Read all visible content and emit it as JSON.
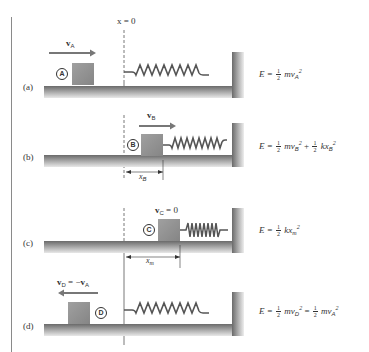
{
  "figure": {
    "origin_label": "x = 0",
    "colors": {
      "block": "#8f8f8f",
      "floor": "#6e6e6e",
      "spring": "#555555",
      "wall": "#7a7a7a",
      "text": "#333333"
    },
    "panels": [
      {
        "id": "a",
        "label": "(a)",
        "block_marker": "A",
        "velocity": {
          "symbol": "v",
          "subscript": "A",
          "direction": "right",
          "text": "v_A"
        },
        "energy": {
          "text": "E = ½ m v_A²",
          "lhs": "E =",
          "frac_num": "1",
          "frac_den": "2",
          "term1": "mv",
          "term1_sub": "A",
          "term1_sup": "2"
        },
        "spring_state": "relaxed"
      },
      {
        "id": "b",
        "label": "(b)",
        "block_marker": "B",
        "velocity": {
          "symbol": "v",
          "subscript": "B",
          "direction": "right",
          "text": "v_B"
        },
        "displacement": {
          "symbol": "x",
          "subscript": "B",
          "text": "x_B"
        },
        "energy": {
          "text": "E = ½ m v_B² + ½ k x_B²",
          "lhs": "E =",
          "frac_num": "1",
          "frac_den": "2",
          "term1": "mv",
          "term1_sub": "B",
          "term1_sup": "2",
          "plus": "+",
          "term2": "kx",
          "term2_sub": "B",
          "term2_sup": "2"
        },
        "spring_state": "compressed"
      },
      {
        "id": "c",
        "label": "(c)",
        "block_marker": "C",
        "velocity": {
          "symbol": "v",
          "subscript": "C",
          "value": "= 0",
          "text": "v_C = 0"
        },
        "displacement": {
          "symbol": "x",
          "subscript": "m",
          "text": "x_m"
        },
        "energy": {
          "text": "E = ½ k x_m²",
          "lhs": "E =",
          "frac_num": "1",
          "frac_den": "2",
          "term1": "kx",
          "term1_sub": "m",
          "term1_sup": "2"
        },
        "spring_state": "max-compressed"
      },
      {
        "id": "d",
        "label": "(d)",
        "block_marker": "D",
        "velocity": {
          "symbol": "v",
          "subscript": "D",
          "value": "= −",
          "rhs_symbol": "v",
          "rhs_subscript": "A",
          "direction": "left",
          "text": "v_D = −v_A"
        },
        "energy": {
          "text": "E = ½ m v_D² = ½ m v_A²",
          "lhs": "E =",
          "frac_num": "1",
          "frac_den": "2",
          "term1": "mv",
          "term1_sub": "D",
          "term1_sup": "2",
          "equals": "=",
          "term2": "mv",
          "term2_sub": "A",
          "term2_sup": "2"
        },
        "spring_state": "relaxed"
      }
    ]
  }
}
